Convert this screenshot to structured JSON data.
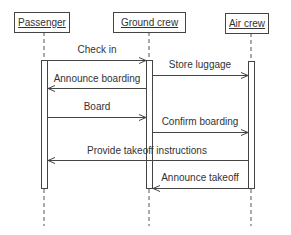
{
  "diagram": {
    "type": "sequence",
    "actors": [
      {
        "id": "passenger",
        "label": "Passenger"
      },
      {
        "id": "ground_crew",
        "label": "Ground crew"
      },
      {
        "id": "air_crew",
        "label": "Air crew"
      }
    ],
    "messages": [
      {
        "from": "passenger",
        "to": "ground_crew",
        "label": "Check in"
      },
      {
        "from": "ground_crew",
        "to": "air_crew",
        "label": "Store luggage"
      },
      {
        "from": "ground_crew",
        "to": "passenger",
        "label": "Announce boarding"
      },
      {
        "from": "passenger",
        "to": "ground_crew",
        "label": "Board"
      },
      {
        "from": "ground_crew",
        "to": "air_crew",
        "label": "Confirm boarding"
      },
      {
        "from": "air_crew",
        "to": "passenger",
        "label": "Provide takeoff instructions"
      },
      {
        "from": "air_crew",
        "to": "ground_crew",
        "label": "Announce takeoff"
      }
    ],
    "colors": {
      "line": "#444444",
      "text": "#333333",
      "background": "#ffffff"
    }
  }
}
